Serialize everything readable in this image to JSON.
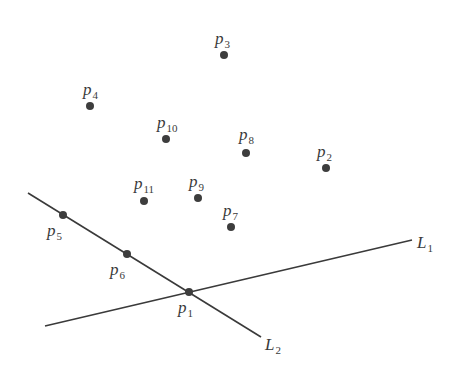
{
  "diagram": {
    "title": "",
    "points": [
      {
        "id": "p1",
        "base": "p",
        "sub": "1",
        "x": 189,
        "y": 292,
        "lx": 178,
        "ly": 313
      },
      {
        "id": "p2",
        "base": "p",
        "sub": "2",
        "x": 326,
        "y": 168,
        "lx": 317,
        "ly": 157
      },
      {
        "id": "p3",
        "base": "p",
        "sub": "3",
        "x": 224,
        "y": 55,
        "lx": 215,
        "ly": 44
      },
      {
        "id": "p4",
        "base": "p",
        "sub": "4",
        "x": 90,
        "y": 106,
        "lx": 83,
        "ly": 95
      },
      {
        "id": "p5",
        "base": "p",
        "sub": "5",
        "x": 63,
        "y": 215,
        "lx": 47,
        "ly": 236
      },
      {
        "id": "p6",
        "base": "p",
        "sub": "6",
        "x": 127,
        "y": 254,
        "lx": 110,
        "ly": 275
      },
      {
        "id": "p7",
        "base": "p",
        "sub": "7",
        "x": 231,
        "y": 227,
        "lx": 223,
        "ly": 216
      },
      {
        "id": "p8",
        "base": "p",
        "sub": "8",
        "x": 246,
        "y": 153,
        "lx": 239,
        "ly": 140
      },
      {
        "id": "p9",
        "base": "p",
        "sub": "9",
        "x": 198,
        "y": 198,
        "lx": 189,
        "ly": 187
      },
      {
        "id": "p10",
        "base": "p",
        "sub": "10",
        "x": 166,
        "y": 139,
        "lx": 157,
        "ly": 128
      },
      {
        "id": "p11",
        "base": "p",
        "sub": "11",
        "x": 144,
        "y": 201,
        "lx": 134,
        "ly": 189
      }
    ],
    "lines": [
      {
        "id": "L1",
        "base": "L",
        "sub": "1",
        "x1": 45,
        "y1": 326,
        "x2": 412,
        "y2": 240,
        "lx": 417,
        "ly": 248
      },
      {
        "id": "L2",
        "base": "L",
        "sub": "2",
        "x1": 28,
        "y1": 193,
        "x2": 261,
        "y2": 337,
        "lx": 265,
        "ly": 350
      }
    ],
    "colors": {
      "ink": "#3a3a3a",
      "background": "#ffffff"
    }
  }
}
